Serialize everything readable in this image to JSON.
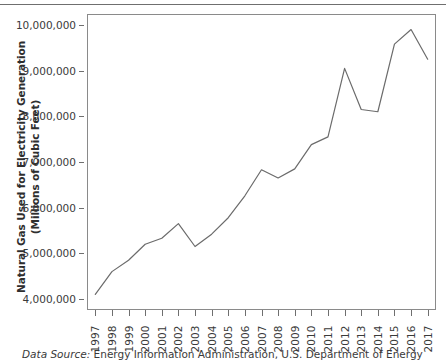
{
  "chart_data": {
    "type": "line",
    "title": "",
    "xlabel": "",
    "ylabel": "Natural Gas Used for Electricity Generation (Millions of Cubic Feet)",
    "ylabel_lines": [
      "Natural Gas Used for Electricity Generation",
      "(Millions of Cubic Feet)"
    ],
    "categories": [
      "1997",
      "1998",
      "1999",
      "2000",
      "2001",
      "2002",
      "2003",
      "2004",
      "2005",
      "2006",
      "2007",
      "2008",
      "2009",
      "2010",
      "2011",
      "2012",
      "2013",
      "2014",
      "2015",
      "2016",
      "2017"
    ],
    "values": [
      4100000,
      4600000,
      4850000,
      5200000,
      5330000,
      5650000,
      5150000,
      5420000,
      5780000,
      6260000,
      6830000,
      6650000,
      6850000,
      7380000,
      7550000,
      9050000,
      8150000,
      8100000,
      9580000,
      9900000,
      9250000
    ],
    "ylim": [
      3760000,
      10240000
    ],
    "ytick_values": [
      4000000,
      5000000,
      6000000,
      7000000,
      8000000,
      9000000,
      10000000
    ],
    "ytick_labels": [
      "4,000,000",
      "5,000,000",
      "6,000,000",
      "7,000,000",
      "8,000,000",
      "9,000,000",
      "10,000,000"
    ],
    "grid": false,
    "legend": false,
    "legend_position": "none",
    "line_color": "#6b6b6b",
    "line_width": 1.2,
    "markers": false
  },
  "caption": {
    "source_label": "Data Source:",
    "source_text": "Energy Information Administration, U.S. Department of Energy"
  },
  "colors": {
    "line": "#6b6b6b",
    "axis": "#8a8a8a",
    "rule": "#6f6f6f",
    "text": "#3a3a3a",
    "background": "#ffffff"
  }
}
